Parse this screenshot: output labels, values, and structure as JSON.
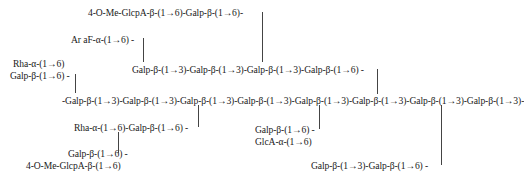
{
  "diagram": {
    "type": "polysaccharide-structure",
    "line_color": "#444444",
    "text_color": "#1a1a1a",
    "labels": {
      "top_branch": "4-O-Me-GlcpA-β-(1→6)-Galp-β-(1→6)-",
      "araf": "Ar aF-α-(1→6) -",
      "upper_chain": "Galp-β-(1→3)-Galp-β-(1→3)-Galp-β-(1→3)-Galp-β-(1→6) -",
      "left_rha": "Rha-α-(1→6)",
      "left_gal": "Galp-β-(1→6) -",
      "main_chain": "-Galp-β-(1→3)-Galp-β-(1→3)-Galp-β-(1→3)-Galp-β-(1→3)-Galp-β-(1→3)-Galp-β-(1→3)-Galp-β-(1→3)-Galp-β-(1→3)-",
      "rha_gal": "Rha-α-(1→6)-Galp-β-(1→6) -",
      "gal_6": "Galp-β-(1→6) -",
      "mid_gal": "Galp-β-(1→6) -",
      "glca": "GlcA-α-(1→6)",
      "bottom_left_glcpa": "4-O-Me-GlcpA-β-(1→6)",
      "bottom_right": "Galp-β-(1→3)-Galp-β-(1→6) -"
    }
  }
}
